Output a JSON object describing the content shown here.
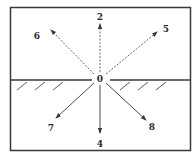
{
  "diagram": {
    "type": "ray directions from origin at interface",
    "origin": {
      "label": "0",
      "x": 100,
      "y": 79
    },
    "frame": {
      "x": 10,
      "y": 7,
      "width": 181,
      "height": 144,
      "stroke": "#3a3a3a"
    },
    "ground_line": {
      "y": 80,
      "left": {
        "x1": 11,
        "x2": 92
      },
      "right": {
        "x1": 110,
        "x2": 190
      },
      "hatch_side": "below",
      "hatches_left": [
        17,
        35,
        53
      ],
      "hatches_right": [
        120,
        138,
        156
      ]
    },
    "rays": [
      {
        "id": "2",
        "label": "2",
        "style": "dashed",
        "tip": [
          100,
          23
        ],
        "label_pos": [
          100,
          19
        ]
      },
      {
        "id": "5",
        "label": "5",
        "style": "dashed",
        "tip": [
          158,
          31
        ],
        "label_pos": [
          166,
          32
        ]
      },
      {
        "id": "6",
        "label": "6",
        "style": "dashed",
        "tip": [
          50,
          29
        ],
        "label_pos": [
          37,
          39
        ]
      },
      {
        "id": "7",
        "label": "7",
        "style": "solid",
        "tip": [
          55,
          119
        ],
        "label_pos": [
          51,
          131
        ]
      },
      {
        "id": "4",
        "label": "4",
        "style": "solid",
        "tip": [
          100,
          134
        ],
        "label_pos": [
          100,
          146
        ]
      },
      {
        "id": "8",
        "label": "8",
        "style": "solid",
        "tip": [
          147,
          121
        ],
        "label_pos": [
          152,
          130
        ]
      }
    ],
    "colors": {
      "line": "#3a3a3a",
      "dashed": "#6a6a6a",
      "solid": "#4a4a4a",
      "text": "#2a2a2a"
    }
  }
}
